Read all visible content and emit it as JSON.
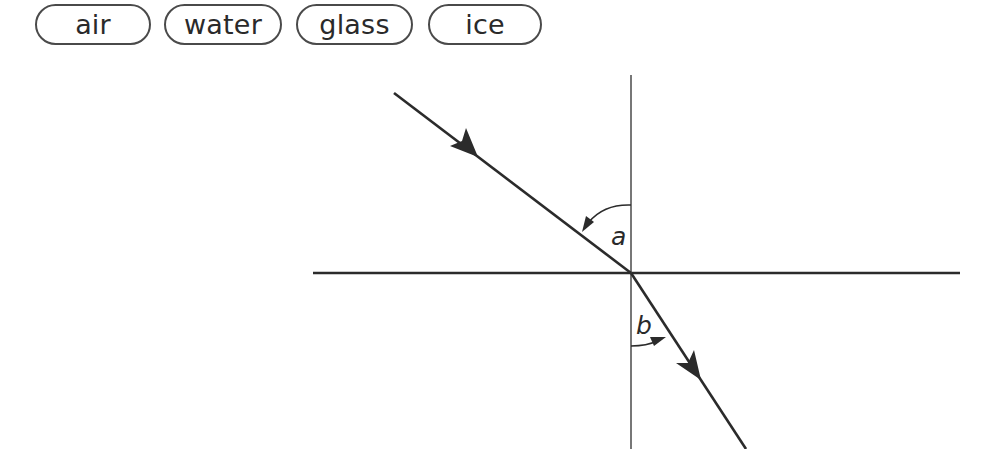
{
  "word_bank": [
    {
      "label": "air"
    },
    {
      "label": "water"
    },
    {
      "label": "glass"
    },
    {
      "label": "ice"
    }
  ],
  "diagram": {
    "angles": {
      "incidence_label": "a",
      "refraction_label": "b"
    },
    "colors": {
      "line": "#2b2b2b",
      "normal": "#555555"
    }
  }
}
